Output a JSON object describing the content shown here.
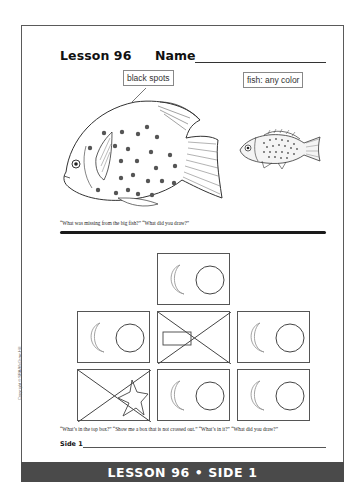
{
  "header": {
    "lesson_title": "Lesson 96",
    "name_label": "Name"
  },
  "part1": {
    "label_big_fish": "black spots",
    "label_small_fish": "fish: any color",
    "caption": "“What was missing from the big fish?” “What did you draw?”"
  },
  "part2": {
    "boxes": [
      {
        "position": "top",
        "content": "moon-and-circle",
        "crossed_out": false
      },
      {
        "position": "row1-left",
        "content": "moon-and-circle",
        "crossed_out": false
      },
      {
        "position": "row1-middle",
        "content": "rectangle",
        "crossed_out": true
      },
      {
        "position": "row1-right",
        "content": "moon-and-circle",
        "crossed_out": false
      },
      {
        "position": "row2-left",
        "content": "star",
        "crossed_out": true
      },
      {
        "position": "row2-middle",
        "content": "moon-and-circle",
        "crossed_out": false
      },
      {
        "position": "row2-right",
        "content": "moon-and-circle",
        "crossed_out": false
      }
    ],
    "caption": "“What’s in the top box?” “Show me a box that is not crossed out.” “What’s in it?” “What did you draw?”"
  },
  "footer": {
    "side_label": "Side 1",
    "copyright": "Copyright © SRA/McGraw-Hill",
    "banner": "LESSON 96 • SIDE 1"
  },
  "colors": {
    "banner_bg": "#4a4a4a",
    "banner_text": "#ffffff",
    "frame": "#5a5a5a"
  }
}
